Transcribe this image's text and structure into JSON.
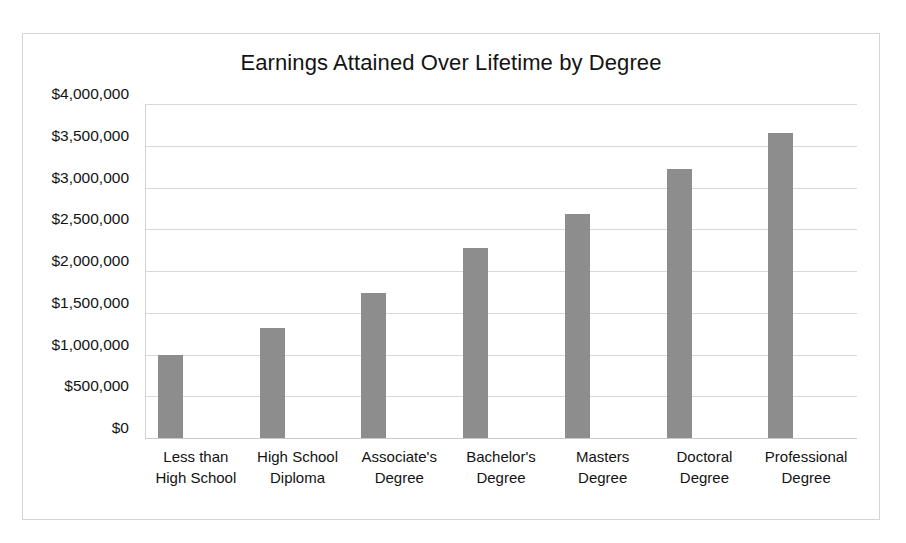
{
  "chart_data": {
    "type": "bar",
    "title": "Earnings Attained Over Lifetime by Degree",
    "xlabel": "",
    "ylabel": "",
    "categories": [
      "Less than High School",
      "High School Diploma",
      "Associate's Degree",
      "Bachelor's Degree",
      "Masters Degree",
      "Doctoral Degree",
      "Professional Degree"
    ],
    "category_lines": [
      [
        "Less than",
        "High School"
      ],
      [
        "High School",
        "Diploma"
      ],
      [
        "Associate's",
        "Degree"
      ],
      [
        "Bachelor's",
        "Degree"
      ],
      [
        "Masters",
        "Degree"
      ],
      [
        "Doctoral",
        "Degree"
      ],
      [
        "Professional",
        "Degree"
      ]
    ],
    "values": [
      990000,
      1320000,
      1740000,
      2270000,
      2680000,
      3220000,
      3650000
    ],
    "ylim": [
      0,
      4000000
    ],
    "ytick_values": [
      4000000,
      3500000,
      3000000,
      2500000,
      2000000,
      1500000,
      1000000,
      500000,
      0
    ],
    "ytick_labels": [
      "$4,000,000",
      "$3,500,000",
      "$3,000,000",
      "$2,500,000",
      "$2,000,000",
      "$1,500,000",
      "$1,000,000",
      "$500,000",
      "$0"
    ],
    "grid": {
      "horizontal": true,
      "vertical": false,
      "color": "#d9d9d9"
    },
    "legend": {
      "visible": false,
      "position": "none"
    },
    "bar_color": "#8d8d8d",
    "plot_background": "#ffffff",
    "border_color": "#d4d4d4"
  },
  "caption": {
    "text": ""
  }
}
